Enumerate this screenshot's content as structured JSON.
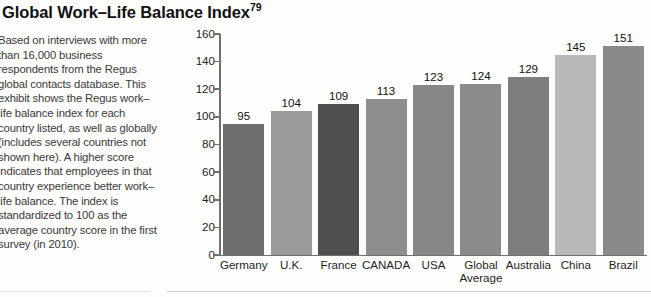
{
  "title": {
    "text": "Global Work–Life Balance Index",
    "footnote_marker": "79"
  },
  "description": "Based on interviews with more than 16,000 business respondents from the Regus global contacts database. This exhibit shows the Regus work–life balance index for each country listed, as well as globally (includes several countries not shown here). A higher score indicates that employees in that country experience better work–life balance. The index is standardized to 100 as the average country score in the first survey (in 2010).",
  "chart_data": {
    "type": "bar",
    "title": "Global Work–Life Balance Index",
    "xlabel": "",
    "ylabel": "",
    "ylim": [
      0,
      160
    ],
    "yticks": [
      0,
      20,
      40,
      60,
      80,
      100,
      120,
      140,
      160
    ],
    "grid": false,
    "legend": "none",
    "categories": [
      "Germany",
      "U.K.",
      "France",
      "CANADA",
      "USA",
      "Global Average",
      "Australia",
      "China",
      "Brazil"
    ],
    "values": [
      95,
      104,
      109,
      113,
      123,
      124,
      129,
      145,
      151
    ],
    "bar_colors": [
      "#6e6e6e",
      "#9a9a9a",
      "#4f4f4f",
      "#8e8e8e",
      "#878787",
      "#8b8b8b",
      "#7e7e7e",
      "#b9b9b9",
      "#8a8a8a"
    ]
  }
}
